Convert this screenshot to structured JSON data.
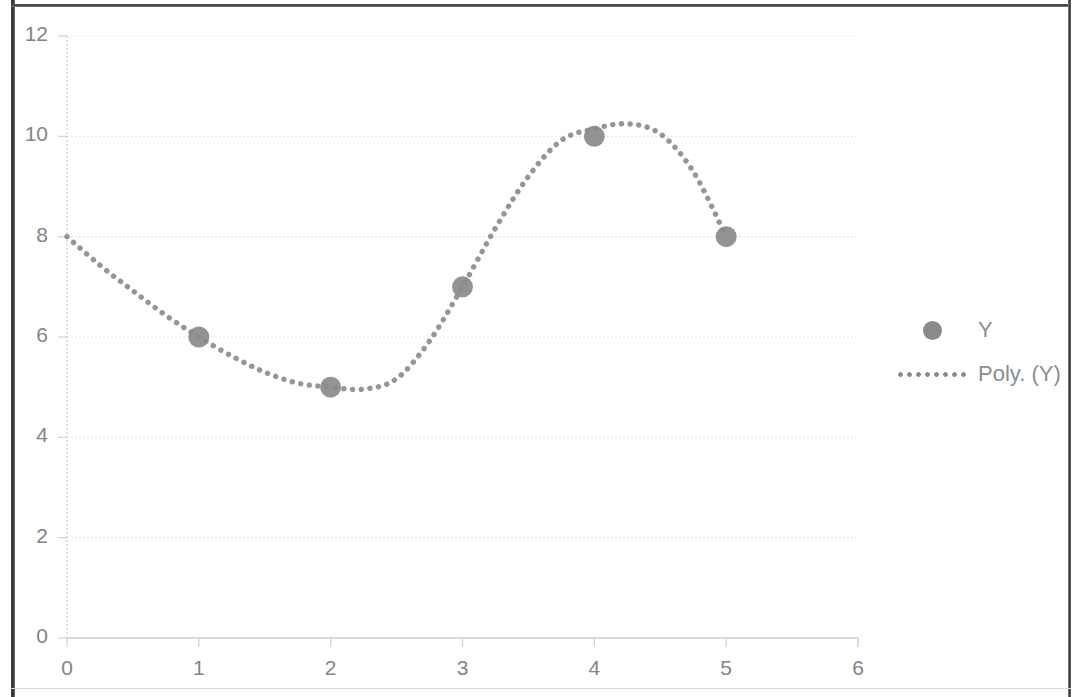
{
  "chart_data": {
    "type": "scatter",
    "title": "",
    "subtitle": "",
    "xlabel": "",
    "ylabel": "",
    "xlim": [
      0,
      6
    ],
    "ylim": [
      0,
      12
    ],
    "x_ticks": [
      "0",
      "1",
      "2",
      "3",
      "4",
      "5",
      "6"
    ],
    "y_ticks": [
      "0",
      "2",
      "4",
      "6",
      "8",
      "10",
      "12"
    ],
    "x_tick_values": [
      0,
      1,
      2,
      3,
      4,
      5,
      6
    ],
    "y_tick_values": [
      0,
      2,
      4,
      6,
      8,
      10,
      12
    ],
    "grid": "horizontal",
    "legend_position": "right",
    "series": [
      {
        "name": "Y",
        "type": "scatter",
        "marker": "circle",
        "color": "#8a8a8a",
        "x": [
          1,
          2,
          3,
          4,
          5
        ],
        "values": [
          6,
          5,
          7,
          10,
          8
        ],
        "points": [
          {
            "x": 1,
            "y": 6
          },
          {
            "x": 2,
            "y": 5
          },
          {
            "x": 3,
            "y": 7
          },
          {
            "x": 4,
            "y": 10
          },
          {
            "x": 5,
            "y": 8
          }
        ]
      },
      {
        "name": "Poly. (Y)",
        "type": "line",
        "line_style": "dotted",
        "color": "#8a8a8a",
        "description": "cubic polynomial trendline",
        "x": [
          0,
          0.25,
          0.5,
          0.75,
          1,
          1.25,
          1.5,
          1.75,
          2,
          2.25,
          2.5,
          2.75,
          3,
          3.25,
          3.5,
          3.75,
          4,
          4.25,
          4.5,
          4.75,
          5
        ],
        "values": [
          8,
          7.43,
          6.92,
          6.43,
          6,
          5.62,
          5.3,
          5.08,
          5,
          4.96,
          5.17,
          5.92,
          7,
          8.17,
          9.2,
          9.92,
          10.15,
          10.25,
          10.05,
          9.3,
          8
        ]
      }
    ]
  },
  "legend": {
    "entries": [
      {
        "label": "Y",
        "key": "marker-dot",
        "color": "#8a8a8a"
      },
      {
        "label": "Poly. (Y)",
        "key": "dotted-line",
        "color": "#8a8a8a"
      }
    ]
  },
  "axes": {
    "y_labels": [
      "12",
      "10",
      "8",
      "6",
      "4",
      "2",
      "0"
    ],
    "x_labels": [
      "0",
      "1",
      "2",
      "3",
      "4",
      "5",
      "6"
    ]
  },
  "colors": {
    "series": "#8a8a8a",
    "gridline": "#e4e4e4",
    "axis": "#d5d5d5",
    "tick_text": "#848484",
    "legend_text": "#8d8d8d",
    "background": "#ffffff",
    "scan_border": "#3a3a3a"
  }
}
